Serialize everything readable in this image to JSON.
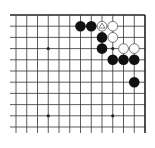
{
  "board": {
    "size": 19,
    "visible_region": "top-right corner",
    "visible_columns": 13,
    "visible_rows": 11,
    "colors": {
      "background": "#ffffff",
      "line": "#333333",
      "edge": "#222222",
      "black_stone": "#111111",
      "white_stone": "#ffffff",
      "white_stone_outline": "#555555",
      "marker": "#777777"
    },
    "star_points": [
      {
        "col": 3,
        "row": 3
      },
      {
        "col": 9,
        "row": 3
      },
      {
        "col": 3,
        "row": 9
      },
      {
        "col": 9,
        "row": 9
      }
    ],
    "stones": [
      {
        "color": "black",
        "col": 6,
        "row": 1
      },
      {
        "color": "black",
        "col": 7,
        "row": 1
      },
      {
        "color": "white",
        "col": 8,
        "row": 1,
        "marker": "triangle"
      },
      {
        "color": "white",
        "col": 9,
        "row": 1
      },
      {
        "color": "black",
        "col": 8,
        "row": 2
      },
      {
        "color": "white",
        "col": 9,
        "row": 2
      },
      {
        "color": "black",
        "col": 8,
        "row": 3
      },
      {
        "color": "white",
        "col": 10,
        "row": 3
      },
      {
        "color": "white",
        "col": 11,
        "row": 3
      },
      {
        "color": "black",
        "col": 9,
        "row": 4
      },
      {
        "color": "black",
        "col": 10,
        "row": 4
      },
      {
        "color": "black",
        "col": 11,
        "row": 4
      },
      {
        "color": "black",
        "col": 11,
        "row": 6
      }
    ]
  }
}
